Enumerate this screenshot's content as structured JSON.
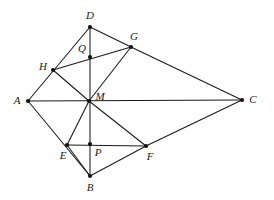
{
  "figure": {
    "width": 274,
    "height": 200,
    "background_color": "#ffffff",
    "line_color": "#1a1a1a",
    "dot_color": "#111111",
    "label_style": "italic-serif"
  },
  "points": [
    {
      "id": "A",
      "label": "A",
      "x": 28,
      "y": 101,
      "label_dx": -11,
      "label_dy": 0,
      "anchor": "middle"
    },
    {
      "id": "B",
      "label": "B",
      "x": 90,
      "y": 176,
      "label_dx": 0,
      "label_dy": 12,
      "anchor": "middle"
    },
    {
      "id": "C",
      "label": "C",
      "x": 242,
      "y": 100,
      "label_dx": 11,
      "label_dy": 0,
      "anchor": "middle"
    },
    {
      "id": "D",
      "label": "D",
      "x": 90,
      "y": 27,
      "label_dx": 0,
      "label_dy": -11,
      "anchor": "middle"
    },
    {
      "id": "E",
      "label": "E",
      "x": 67,
      "y": 145,
      "label_dx": -4,
      "label_dy": 11,
      "anchor": "middle"
    },
    {
      "id": "F",
      "label": "F",
      "x": 146,
      "y": 146,
      "label_dx": 4,
      "label_dy": 11,
      "anchor": "middle"
    },
    {
      "id": "G",
      "label": "G",
      "x": 131,
      "y": 47,
      "label_dx": 3,
      "label_dy": -10,
      "anchor": "middle"
    },
    {
      "id": "H",
      "label": "H",
      "x": 53,
      "y": 70,
      "label_dx": -10,
      "label_dy": -3,
      "anchor": "middle"
    },
    {
      "id": "M",
      "label": "M",
      "x": 89,
      "y": 101,
      "label_dx": 11,
      "label_dy": -4,
      "anchor": "middle"
    },
    {
      "id": "P",
      "label": "P",
      "x": 90,
      "y": 144,
      "label_dx": 8,
      "label_dy": 9,
      "anchor": "middle"
    },
    {
      "id": "Q",
      "label": "Q",
      "x": 90,
      "y": 57,
      "label_dx": -8,
      "label_dy": -8,
      "anchor": "middle"
    }
  ],
  "edges": [
    {
      "id": "edge-A-D",
      "from": "A",
      "to": "D",
      "via": [
        "H"
      ]
    },
    {
      "id": "edge-A-C",
      "from": "A",
      "to": "C",
      "via": [
        "M"
      ]
    },
    {
      "id": "edge-A-B",
      "from": "A",
      "to": "B",
      "via": [
        "E"
      ]
    },
    {
      "id": "edge-D-G",
      "from": "D",
      "to": "G"
    },
    {
      "id": "edge-D-B",
      "from": "D",
      "to": "B",
      "via": [
        "Q",
        "M",
        "P"
      ]
    },
    {
      "id": "edge-H-G",
      "from": "H",
      "to": "G",
      "via": [
        "Q"
      ]
    },
    {
      "id": "edge-H-M",
      "from": "H",
      "to": "M"
    },
    {
      "id": "edge-M-G",
      "from": "M",
      "to": "G"
    },
    {
      "id": "edge-G-C",
      "from": "G",
      "to": "C"
    },
    {
      "id": "edge-M-E",
      "from": "M",
      "to": "E"
    },
    {
      "id": "edge-E-F",
      "from": "E",
      "to": "F",
      "via": [
        "P"
      ]
    },
    {
      "id": "edge-M-F",
      "from": "M",
      "to": "F"
    },
    {
      "id": "edge-F-C",
      "from": "F",
      "to": "C"
    },
    {
      "id": "edge-E-B",
      "from": "E",
      "to": "B"
    },
    {
      "id": "edge-B-F",
      "from": "B",
      "to": "F"
    }
  ],
  "dot_radius": 2.1
}
